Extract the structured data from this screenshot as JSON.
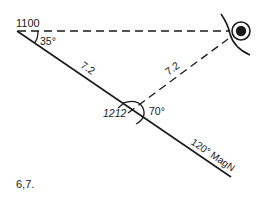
{
  "diagram": {
    "type": "navigation-plot",
    "start_time": "1100",
    "fix_time": "1212",
    "bearing_angle_start": "35°",
    "angle_at_fix": "70°",
    "course_distance": "7.2",
    "return_distance": "7.2",
    "course_label": "120° MagN",
    "figure_label": "6,7.",
    "colors": {
      "ink": "#1a1a1a",
      "background": "#ffffff"
    }
  }
}
